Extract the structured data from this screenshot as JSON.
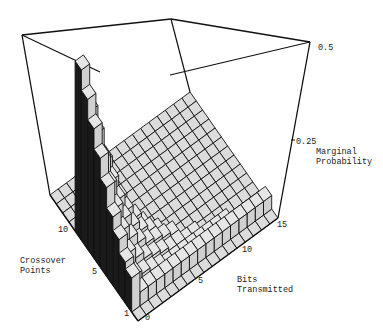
{
  "chart_data": {
    "type": "bar3d",
    "title": "",
    "zlabel": "Marginal Probability",
    "xlabel": "Bits Transmitted",
    "ylabel": "Crossover Points",
    "z_ticks": [
      "0.25",
      "0.5"
    ],
    "x_ticks": [
      "0",
      "5",
      "10",
      "15"
    ],
    "y_ticks": [
      "1",
      "5",
      "10"
    ],
    "zlim": [
      0,
      0.5
    ],
    "bits_range": [
      0,
      16
    ],
    "crossover_range": [
      1,
      14
    ],
    "note": "Heights estimated from the staircase shape; tallest column ~0.5 at the back of the staircase.",
    "rows": [
      {
        "crossover": 1,
        "heights": [
          0,
          0,
          0,
          0,
          0,
          0,
          0,
          0,
          0,
          0,
          0,
          0,
          0,
          0,
          0,
          0,
          0
        ]
      },
      {
        "crossover": 2,
        "heights": [
          0.1,
          0.04,
          0.04,
          0.04,
          0.04,
          0.04,
          0.04,
          0.04,
          0.04,
          0.04,
          0.04,
          0.04,
          0.04,
          0.04,
          0.04,
          0.04,
          0.04
        ]
      },
      {
        "crossover": 3,
        "heights": [
          0.12,
          0.06,
          0.05,
          0.04,
          0.03,
          0.02,
          0.02,
          0.02,
          0.02,
          0.02,
          0.02,
          0.02,
          0.02,
          0,
          0,
          0,
          0
        ]
      },
      {
        "crossover": 4,
        "heights": [
          0.16,
          0.1,
          0.07,
          0.05,
          0.04,
          0.03,
          0.02,
          0.02,
          0.01,
          0.01,
          0,
          0,
          0,
          0,
          0,
          0,
          0
        ]
      },
      {
        "crossover": 5,
        "heights": [
          0.2,
          0.14,
          0.1,
          0.07,
          0.05,
          0.04,
          0.03,
          0.02,
          0,
          0,
          0,
          0,
          0,
          0,
          0,
          0,
          0
        ]
      },
      {
        "crossover": 6,
        "heights": [
          0.26,
          0.18,
          0.13,
          0.09,
          0.06,
          0.04,
          0.02,
          0,
          0,
          0,
          0,
          0,
          0,
          0,
          0,
          0,
          0
        ]
      },
      {
        "crossover": 7,
        "heights": [
          0.32,
          0.22,
          0.16,
          0.11,
          0.07,
          0.03,
          0,
          0,
          0,
          0,
          0,
          0,
          0,
          0,
          0,
          0,
          0
        ]
      },
      {
        "crossover": 8,
        "heights": [
          0.38,
          0.27,
          0.19,
          0.12,
          0.05,
          0,
          0,
          0,
          0,
          0,
          0,
          0,
          0,
          0,
          0,
          0,
          0
        ]
      },
      {
        "crossover": 9,
        "heights": [
          0.44,
          0.32,
          0.22,
          0.12,
          0,
          0,
          0,
          0,
          0,
          0,
          0,
          0,
          0,
          0,
          0,
          0,
          0
        ]
      },
      {
        "crossover": 10,
        "heights": [
          0.5,
          0.36,
          0.22,
          0,
          0,
          0,
          0,
          0,
          0,
          0,
          0,
          0,
          0,
          0,
          0,
          0,
          0
        ]
      },
      {
        "crossover": 11,
        "heights": [
          0,
          0,
          0,
          0,
          0,
          0,
          0,
          0,
          0,
          0,
          0,
          0,
          0,
          0,
          0,
          0,
          0
        ]
      },
      {
        "crossover": 12,
        "heights": [
          0,
          0,
          0,
          0,
          0,
          0,
          0,
          0,
          0,
          0,
          0,
          0,
          0,
          0,
          0,
          0,
          0
        ]
      },
      {
        "crossover": 13,
        "heights": [
          0,
          0,
          0,
          0,
          0,
          0,
          0,
          0,
          0,
          0,
          0,
          0,
          0,
          0,
          0,
          0,
          0
        ]
      },
      {
        "crossover": 14,
        "heights": [
          0,
          0,
          0,
          0,
          0,
          0,
          0,
          0,
          0,
          0,
          0,
          0,
          0,
          0,
          0,
          0,
          0
        ]
      }
    ]
  },
  "labels": {
    "z_tick_top": "0.5",
    "z_tick_mid": "0.25",
    "z_axis": "Marginal\nProbability",
    "y_axis": "Crossover\nPoints",
    "x_axis": "Bits\nTransmitted",
    "y_tick_10": "10",
    "y_tick_5": "5",
    "y_tick_1": "1",
    "x_tick_0": "0",
    "x_tick_5": "5",
    "x_tick_10": "10",
    "x_tick_15": "15"
  },
  "colors": {
    "top": "#e6e6e6",
    "front": "#d0d0d0",
    "side": "#1a1a1a",
    "edge": "#111111",
    "floor": "#dcdcdc"
  }
}
